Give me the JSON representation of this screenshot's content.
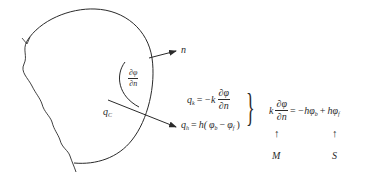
{
  "diagram": {
    "type": "boundary-condition-schematic",
    "labels": {
      "normal": "n",
      "gradient_num": "∂φ",
      "gradient_den": "∂n",
      "conduction_flux": "q",
      "conduction_flux_sub": "C"
    },
    "equations": {
      "qk": {
        "lhs": "q",
        "lhs_sub": "k",
        "eq": "=",
        "coef": "−k",
        "num": "∂φ",
        "den": "∂n"
      },
      "qh": {
        "lhs": "q",
        "lhs_sub": "h",
        "eq": "=",
        "rhs_prefix": "h(",
        "phi1": "φ",
        "phi1_sub": "b",
        "minus": "−",
        "phi2": "φ",
        "phi2_sub": "f",
        "rhs_suffix": ")"
      },
      "brace": "}",
      "combined": {
        "coef": "k",
        "num": "∂φ",
        "den": "∂n",
        "eq": "=",
        "term1": "−hφ",
        "term1_sub": "b",
        "plus": "+",
        "term2": "hφ",
        "term2_sub": "f"
      }
    },
    "annotations": {
      "arrow_glyph": "↑",
      "matrix_label": "M",
      "source_label": "S"
    },
    "colors": {
      "stroke": "#2a2a2a",
      "background": "#ffffff"
    }
  }
}
